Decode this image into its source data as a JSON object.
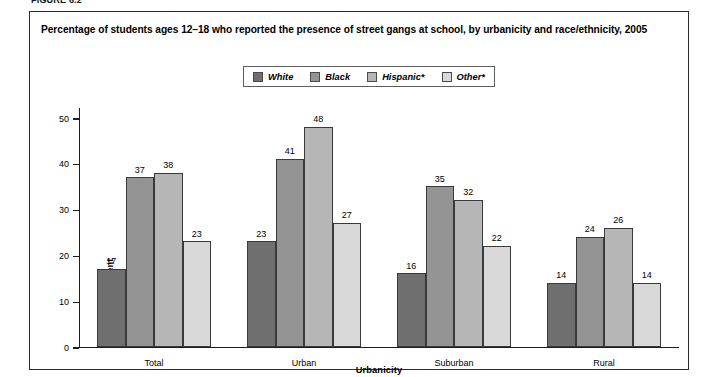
{
  "figure_number": "FIGURE 6.2",
  "title": "Percentage of students ages 12–18 who reported the presence of street gangs at school, by urbanicity and race/ethnicity, 2005",
  "legend": {
    "items": [
      {
        "label": "White",
        "color": "#6f6f6f"
      },
      {
        "label": "Black",
        "color": "#949494"
      },
      {
        "label": "Hispanic*",
        "color": "#b6b6b6"
      },
      {
        "label": "Other*",
        "color": "#d9d9d9"
      }
    ]
  },
  "chart_data": {
    "type": "bar",
    "title": "Percentage of students ages 12–18 who reported the presence of street gangs at school, by urbanicity and race/ethnicity, 2005",
    "categories": [
      "Total",
      "Urban",
      "Suburban",
      "Rural"
    ],
    "series": [
      {
        "name": "White",
        "color": "#6f6f6f",
        "values": [
          17,
          23,
          16,
          14
        ]
      },
      {
        "name": "Black",
        "color": "#949494",
        "values": [
          37,
          41,
          35,
          24
        ]
      },
      {
        "name": "Hispanic*",
        "color": "#b6b6b6",
        "values": [
          38,
          48,
          32,
          26
        ]
      },
      {
        "name": "Other*",
        "color": "#d9d9d9",
        "values": [
          23,
          27,
          22,
          14
        ]
      }
    ],
    "xlabel": "Urbanicity",
    "ylabel": "Percent",
    "ylim": [
      0,
      50
    ],
    "yticks": [
      0,
      10,
      20,
      30,
      40,
      50
    ],
    "ytick_labels": [
      "0",
      "10",
      "20",
      "30",
      "40",
      "50"
    ],
    "grid": false,
    "legend_position": "top-center",
    "data_labels": true
  }
}
